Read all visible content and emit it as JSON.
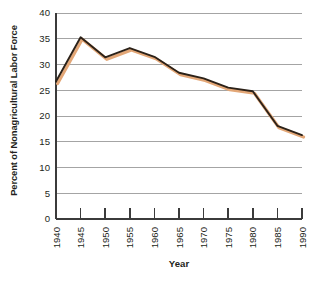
{
  "chart_data": {
    "type": "line",
    "title": "",
    "xlabel": "Year",
    "ylabel": "Percent of Nonagricultural Labor Force",
    "x": [
      1940,
      1945,
      1950,
      1955,
      1960,
      1965,
      1970,
      1975,
      1980,
      1985,
      1990
    ],
    "categories": [
      "1940",
      "1945",
      "1950",
      "1955",
      "1960",
      "1965",
      "1970",
      "1975",
      "1980",
      "1985",
      "1990"
    ],
    "values": [
      26.7,
      35.3,
      31.4,
      33.2,
      31.5,
      28.4,
      27.3,
      25.5,
      24.8,
      18.1,
      16.3
    ],
    "series": [
      {
        "name": "Percent of Nonagricultural Labor Force",
        "values": [
          26.7,
          35.3,
          31.4,
          33.2,
          31.5,
          28.4,
          27.3,
          25.5,
          24.8,
          18.1,
          16.3
        ],
        "line_color": "#2b2118",
        "shadow_color": "#e0a濃76"
      }
    ],
    "xlim": [
      1940,
      1990
    ],
    "ylim": [
      0,
      40
    ],
    "ytick_values": [
      0,
      5,
      10,
      15,
      20,
      25,
      30,
      35,
      40
    ],
    "ytick_labels": [
      "0",
      "5",
      "10",
      "15",
      "20",
      "25",
      "30",
      "35",
      "40"
    ],
    "xtick_labels": [
      "1940",
      "1945",
      "1950",
      "1955",
      "1960",
      "1965",
      "1970",
      "1975",
      "1980",
      "1985",
      "1990"
    ],
    "grid": true,
    "grid_color": "#9a9a9a",
    "legend": false,
    "legend_position": "none",
    "line_color": "#2b2118",
    "shadow_color": "#e3a777",
    "axis_color": "#3b3b3b",
    "background_color": "#ffffff"
  },
  "axis_titles": {
    "y": "Percent of Nonagricultural Labor Force",
    "x": "Year"
  },
  "caption_fragment": ""
}
